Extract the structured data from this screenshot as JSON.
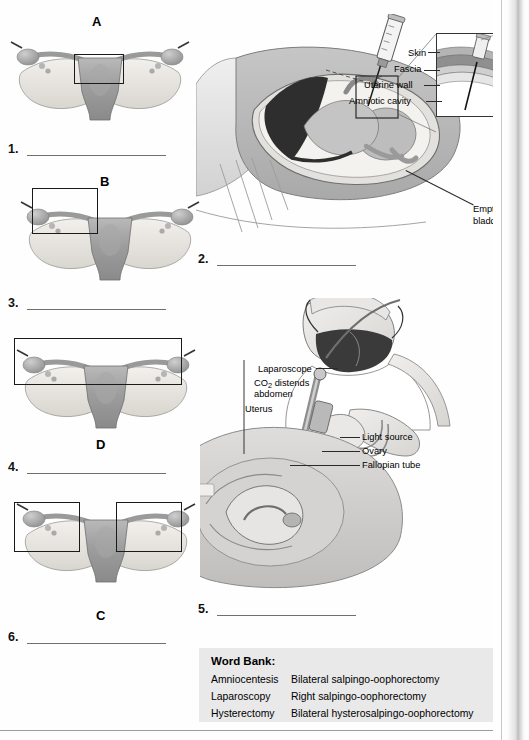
{
  "blanks": [
    {
      "n": "1."
    },
    {
      "n": "2."
    },
    {
      "n": "3."
    },
    {
      "n": "4."
    },
    {
      "n": "5."
    },
    {
      "n": "6."
    }
  ],
  "specimens": [
    {
      "letter": "A",
      "caption": "uterus body highlighted"
    },
    {
      "letter": "B",
      "caption": "left adnexa highlighted"
    },
    {
      "letter": "D",
      "caption": "both adnexa highlighted in one wide box"
    },
    {
      "letter": "C",
      "caption": "both adnexa highlighted in two boxes"
    }
  ],
  "amniocentesis": {
    "labels": [
      "Skin",
      "Fascia",
      "Uterine wall",
      "Amniotic cavity"
    ],
    "bladder_line1": "Empty",
    "bladder_line2": "bladder",
    "angle": "90°"
  },
  "laparoscopy": {
    "laparoscope": "Laparoscope",
    "co2_line1_pre": "CO",
    "co2_sub": "2",
    "co2_line1_post": " distends",
    "co2_line2": "abdomen",
    "uterus": "Uterus",
    "light_source": "Light source",
    "ovary": "Ovary",
    "fallopian_tube": "Fallopian tube"
  },
  "word_bank": {
    "title": "Word Bank:",
    "col1": [
      "Amniocentesis",
      "Laparoscopy",
      "Hysterectomy"
    ],
    "col2": [
      "Bilateral salpingo-oophorectomy",
      "Right salpingo-oophorectomy",
      "Bilateral hysterosalpingo-oophorectomy"
    ]
  },
  "colors": {
    "ink": "#000000",
    "rule": "#6f6f6f",
    "wordbank_bg": "#e9e9e9",
    "box_stroke": "#1a1a1a"
  }
}
